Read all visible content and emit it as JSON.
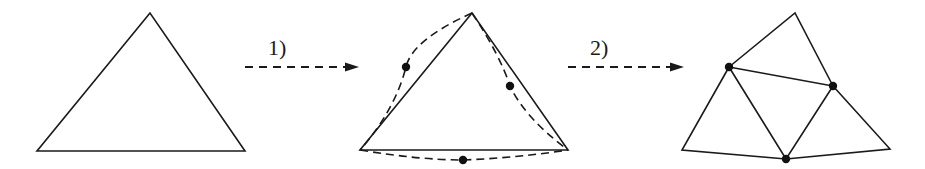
{
  "diagram": {
    "colors": {
      "stroke": "#1a1a1a",
      "dot": "#111111",
      "background": "#ffffff"
    },
    "steps": [
      {
        "label": "1)"
      },
      {
        "label": "2)"
      }
    ],
    "panels": [
      {
        "name": "original-triangle",
        "vertices": [
          [
            150,
            13
          ],
          [
            37,
            151
          ],
          [
            245,
            151
          ]
        ]
      },
      {
        "name": "triangle-with-curved-edges",
        "vertices": [
          [
            472,
            13
          ],
          [
            360,
            150
          ],
          [
            568,
            150
          ]
        ],
        "edge_midpoints": [
          [
            406,
            67
          ],
          [
            510,
            86
          ],
          [
            463,
            160
          ]
        ]
      },
      {
        "name": "subdivided-triangle",
        "outer_vertices": [
          [
            795,
            13
          ],
          [
            682,
            150
          ],
          [
            890,
            149
          ]
        ],
        "new_vertices": [
          [
            729,
            67
          ],
          [
            833,
            86
          ],
          [
            786,
            159
          ]
        ]
      }
    ]
  }
}
